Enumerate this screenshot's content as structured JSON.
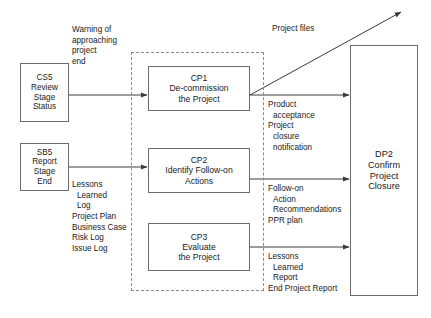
{
  "diagram": {
    "type": "process-flow",
    "colors": {
      "box_border": "#6b6b6b",
      "dashed_border": "#8a8a8a",
      "arrow": "#3a3a3a",
      "text": "#1a1a1a",
      "background": "#ffffff"
    }
  },
  "inputs": {
    "cs5": {
      "id": "CS5",
      "line1": "CS5",
      "line2": "Review",
      "line3": "Stage",
      "line4": "Status"
    },
    "sb5": {
      "id": "SB5",
      "line1": "SB5",
      "line2": "Report",
      "line3": "Stage",
      "line4": "End"
    }
  },
  "process": {
    "cp1": {
      "id": "CP1",
      "line1": "CP1",
      "line2": "De-commission",
      "line3": "the Project"
    },
    "cp2": {
      "id": "CP2",
      "line1": "CP2",
      "line2": "Identify Follow-on",
      "line3": "Actions"
    },
    "cp3": {
      "id": "CP3",
      "line1": "CP3",
      "line2": "Evaluate",
      "line3": "the Project"
    }
  },
  "output": {
    "dp2": {
      "id": "DP2",
      "line1": "DP2",
      "line2": "Confirm",
      "line3": "Project",
      "line4": "Closure"
    }
  },
  "labels": {
    "warning": {
      "line1": "Warning of",
      "line2": "approaching",
      "line3": "project",
      "line4": "end"
    },
    "sb5_outputs": {
      "line1": "Lessons",
      "line2": "Learned",
      "line3": "Log",
      "line4": "Project Plan",
      "line5": "Business Case",
      "line6": "Risk Log",
      "line7": "Issue Log"
    },
    "project_files": "Project files",
    "cp1_outputs": {
      "line1": "Product",
      "line2": "acceptance",
      "line3": "Project",
      "line4": "closure",
      "line5": "notification"
    },
    "cp2_outputs": {
      "line1": "Follow-on",
      "line2": "Action",
      "line3": "Recommendations",
      "line4": "PPR plan"
    },
    "cp3_outputs": {
      "line1": "Lessons",
      "line2": "Learned",
      "line3": "Report",
      "line4": "End Project Report"
    }
  }
}
